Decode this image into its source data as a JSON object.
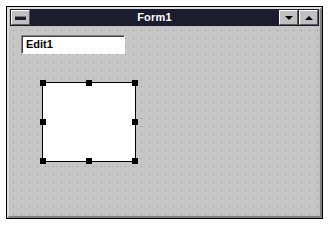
{
  "window": {
    "title": "Form1",
    "sysmenu_icon": "sysmenu-bar-icon",
    "minimize_icon": "arrow-down-icon",
    "maximize_icon": "arrow-up-icon",
    "minimize_label": "",
    "maximize_label": ""
  },
  "form": {
    "name": "Form1",
    "grid_spacing": 8,
    "background_color": "#c6c6c6",
    "titlebar_color": "#1c1c2e",
    "titlebar_text_color": "#ffffff",
    "face_color": "#c0c0c0",
    "selection_handle_color": "#000000"
  },
  "controls": {
    "edit": {
      "name": "Edit1",
      "text": "Edit1",
      "placeholder": "",
      "background_color": "#ffffff",
      "selected": false
    },
    "panel": {
      "name": "Panel1",
      "text": "",
      "background_color": "#ffffff",
      "selected": true,
      "handle_count": 8
    }
  }
}
